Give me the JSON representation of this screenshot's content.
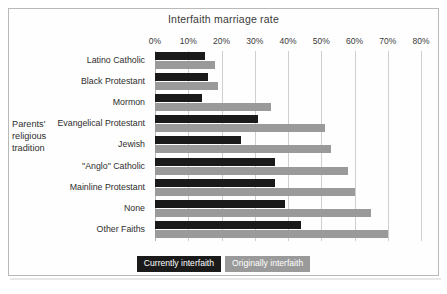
{
  "chart_data": {
    "type": "bar",
    "orientation": "horizontal",
    "title": "Interfaith marriage rate",
    "xlabel": "Interfaith marriage rate",
    "ylabel": "Parents' religious tradition",
    "grid": true,
    "legend_position": "bottom",
    "xlim": [
      0,
      80
    ],
    "xticks": [
      0,
      10,
      20,
      30,
      40,
      50,
      60,
      70,
      80
    ],
    "xtick_labels": [
      "0%",
      "10%",
      "20%",
      "30%",
      "40%",
      "50%",
      "60%",
      "70%",
      "80%"
    ],
    "categories": [
      "Latino Catholic",
      "Black Protestant",
      "Mormon",
      "Evangelical Protestant",
      "Jewish",
      "\"Anglo\" Catholic",
      "Mainline Protestant",
      "None",
      "Other Faiths"
    ],
    "series": [
      {
        "name": "Currently interfaith",
        "color": "#1a1a1a",
        "values": [
          15,
          16,
          14,
          31,
          26,
          36,
          36,
          39,
          44
        ]
      },
      {
        "name": "Originally interfaith",
        "color": "#9a9a9a",
        "values": [
          18,
          19,
          35,
          51,
          53,
          58,
          60,
          65,
          70
        ]
      }
    ]
  },
  "legend": {
    "items": [
      {
        "label": "Currently interfaith"
      },
      {
        "label": "Originally interfaith"
      }
    ]
  },
  "axis": {
    "y_title_lines": [
      "Parents'",
      "religious",
      "tradition"
    ]
  },
  "colors": {
    "current": "#1a1a1a",
    "original": "#9a9a9a",
    "gridline": "#cfcfcf",
    "frame": "#b9b9b9",
    "text": "#2e2e2e",
    "background": "#ffffff"
  }
}
